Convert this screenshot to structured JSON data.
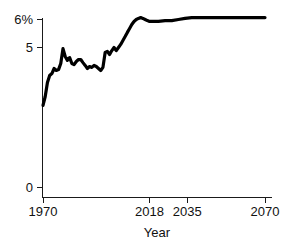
{
  "chart_data": {
    "type": "line",
    "title": "",
    "subtitle": "",
    "xlabel": "Year",
    "ylabel": "",
    "xlim": [
      1970,
      2070
    ],
    "ylim": [
      0,
      6.6
    ],
    "grid": false,
    "legend": false,
    "legend_position": "none",
    "line_color": "#000000",
    "axis_color": "#1a1a1a",
    "background_color": "#ffffff",
    "x_ticks": [
      {
        "value": 1970,
        "label": "1970"
      },
      {
        "value": 2018,
        "label": "2018"
      },
      {
        "value": 2035,
        "label": "2035"
      },
      {
        "value": 2070,
        "label": "2070"
      }
    ],
    "y_ticks": [
      {
        "value": 0,
        "label": "0"
      },
      {
        "value": 5,
        "label": "5"
      },
      {
        "value": 6,
        "label": "6%"
      }
    ],
    "series": [
      {
        "name": "share",
        "x": [
          1970,
          1971,
          1972,
          1973,
          1974,
          1975,
          1976,
          1977,
          1978,
          1979,
          1980,
          1981,
          1982,
          1983,
          1984,
          1985,
          1986,
          1987,
          1988,
          1989,
          1990,
          1991,
          1992,
          1993,
          1994,
          1995,
          1996,
          1997,
          1998,
          1999,
          2000,
          2001,
          2002,
          2003,
          2004,
          2005,
          2006,
          2007,
          2008,
          2009,
          2010,
          2011,
          2012,
          2013,
          2014,
          2015,
          2016,
          2017,
          2018,
          2019,
          2022,
          2025,
          2028,
          2031,
          2034,
          2037,
          2040,
          2043,
          2046,
          2049,
          2052,
          2055,
          2058,
          2061,
          2064,
          2067,
          2070
        ],
        "y": [
          2.93,
          3.25,
          3.75,
          4.0,
          4.07,
          4.25,
          4.18,
          4.21,
          4.43,
          4.96,
          4.68,
          4.54,
          4.64,
          4.43,
          4.39,
          4.5,
          4.57,
          4.57,
          4.46,
          4.36,
          4.25,
          4.32,
          4.29,
          4.36,
          4.32,
          4.25,
          4.18,
          4.29,
          4.82,
          4.86,
          4.75,
          4.89,
          5.0,
          4.89,
          5.0,
          5.11,
          5.25,
          5.39,
          5.54,
          5.68,
          5.82,
          5.93,
          6.0,
          6.04,
          6.07,
          6.04,
          6.0,
          5.96,
          5.93,
          5.93,
          5.93,
          5.96,
          5.96,
          6.0,
          6.04,
          6.07,
          6.07,
          6.07,
          6.07,
          6.07,
          6.07,
          6.07,
          6.07,
          6.07,
          6.07,
          6.07,
          6.07
        ]
      }
    ],
    "annotations": []
  },
  "axis": {
    "x_title": "Year"
  }
}
